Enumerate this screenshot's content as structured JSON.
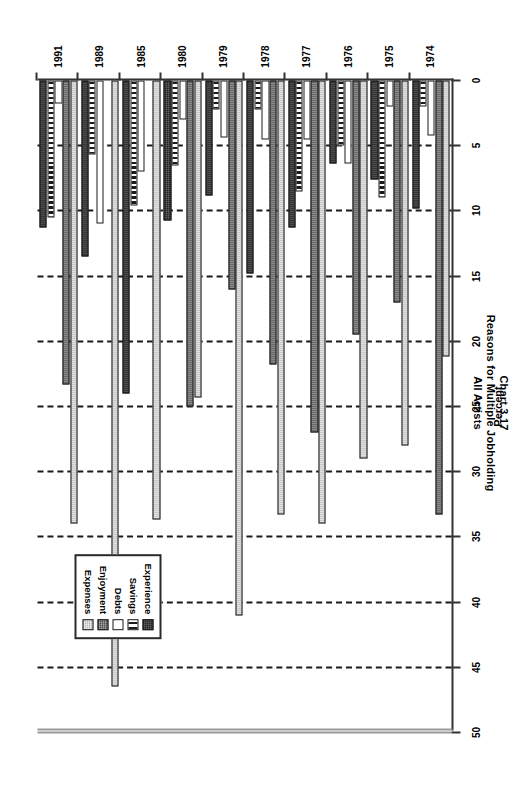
{
  "title": {
    "line1": "Chart 3.17",
    "line2": "Reasons for Multiple Jobholding",
    "line3": "All Artists"
  },
  "axis": {
    "value_title": "Percent",
    "ticks": [
      "0",
      "5",
      "10",
      "15",
      "20",
      "25",
      "30",
      "35",
      "40",
      "45",
      "50"
    ]
  },
  "legend": {
    "items": [
      {
        "label": "Expenses",
        "swatch": "light-gray-hatch"
      },
      {
        "label": "Enjoyment",
        "swatch": "dark-gray-hatch"
      },
      {
        "label": "Debts",
        "swatch": "white"
      },
      {
        "label": "Savings",
        "swatch": "vertical-stripe"
      },
      {
        "label": "Experience",
        "swatch": "black"
      }
    ]
  },
  "chart_data": {
    "type": "bar",
    "orientation": "horizontal",
    "xlabel": "Percent",
    "ylabel": "",
    "xlim": [
      0,
      50
    ],
    "xticks": [
      0,
      5,
      10,
      15,
      20,
      25,
      30,
      35,
      40,
      45,
      50
    ],
    "grid": true,
    "legend_position": "bottom-right",
    "categories": [
      "1974",
      "1975",
      "1976",
      "1977",
      "1978",
      "1979",
      "1980",
      "1985",
      "1989",
      "1991"
    ],
    "series": [
      {
        "name": "Expenses",
        "color": "#b4b4b4",
        "values": [
          21.2,
          28.0,
          29.0,
          34.0,
          33.3,
          41.0,
          24.3,
          33.7,
          46.5,
          34.0
        ]
      },
      {
        "name": "Enjoyment",
        "color": "#4f4f4f",
        "values": [
          33.3,
          17.0,
          19.5,
          27.0,
          21.8,
          16.0,
          25.0,
          0.0,
          0.0,
          23.3
        ]
      },
      {
        "name": "Debts",
        "color": "#ffffff",
        "values": [
          4.2,
          2.0,
          6.4,
          4.5,
          4.5,
          4.4,
          3.0,
          7.0,
          11.0,
          1.8
        ]
      },
      {
        "name": "Savings",
        "color": "#ffffff",
        "values": [
          2.0,
          9.0,
          5.0,
          8.5,
          2.2,
          2.2,
          6.5,
          9.6,
          5.7,
          10.5
        ]
      },
      {
        "name": "Experience",
        "color": "#232323",
        "values": [
          9.8,
          7.6,
          6.4,
          11.3,
          14.8,
          8.8,
          10.7,
          24.0,
          13.5,
          11.3
        ]
      }
    ]
  }
}
